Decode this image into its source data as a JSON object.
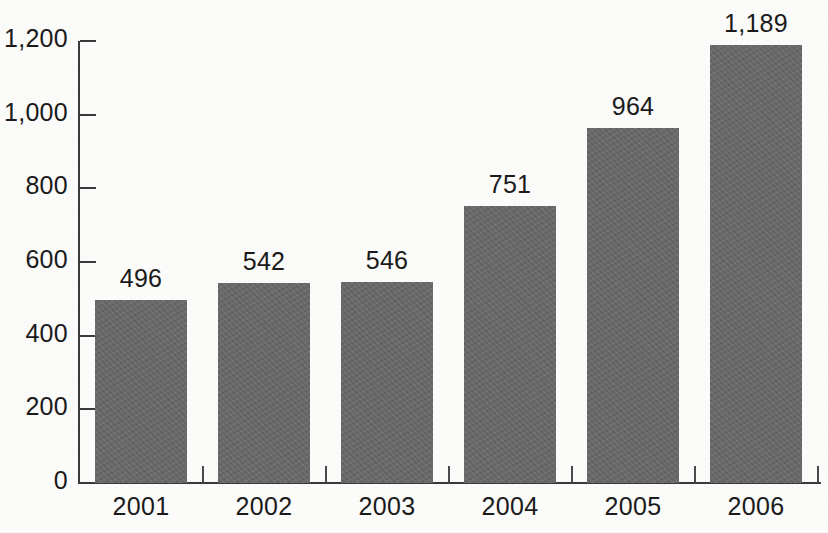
{
  "chart_data": {
    "type": "bar",
    "title": "",
    "subtitle": "",
    "xlabel": "",
    "ylabel": "",
    "categories": [
      "2001",
      "2002",
      "2003",
      "2004",
      "2005",
      "2006"
    ],
    "values": [
      496,
      542,
      546,
      751,
      964,
      1189
    ],
    "value_labels": [
      "496",
      "542",
      "546",
      "751",
      "964",
      "1,189"
    ],
    "ylim": [
      0,
      1200
    ],
    "yticks": [
      0,
      200,
      400,
      600,
      800,
      1000,
      1200
    ],
    "ytick_labels": [
      "0",
      "200",
      "400",
      "600",
      "800",
      "1,000",
      "1,200"
    ],
    "grid": false,
    "legend": null,
    "series": [
      {
        "name": "",
        "values": [
          496,
          542,
          546,
          751,
          964,
          1189
        ]
      }
    ],
    "colors": {
      "bar": "#6a6a6a",
      "axis": "#3a3a3a",
      "text": "#1a1a1a",
      "background": "#fdfdfc"
    }
  }
}
